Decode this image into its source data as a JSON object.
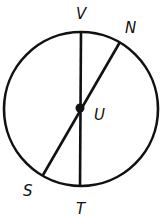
{
  "diagram": {
    "type": "circle-geometry",
    "center": {
      "label": "U",
      "x": 81,
      "y": 109
    },
    "radius": 77,
    "points": {
      "V": {
        "label": "V",
        "x": 81,
        "y": 31
      },
      "T": {
        "label": "T",
        "x": 80,
        "y": 187
      },
      "N": {
        "label": "N",
        "x": 120,
        "y": 42
      },
      "S": {
        "label": "S",
        "x": 43,
        "y": 175
      }
    },
    "segments": [
      "VT",
      "NS"
    ],
    "stroke_color": "#111111"
  }
}
